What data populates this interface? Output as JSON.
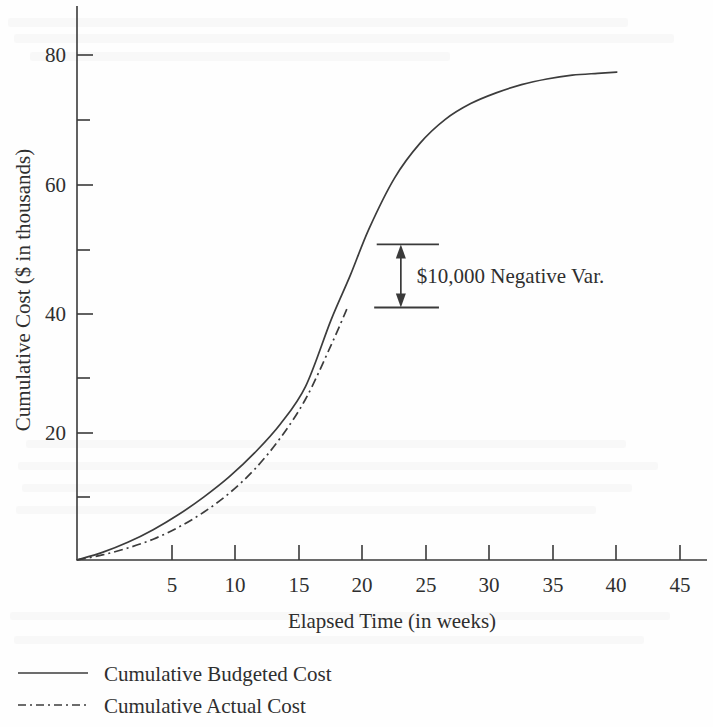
{
  "chart_data": {
    "type": "line",
    "title": "",
    "xlabel": "Elapsed Time (in weeks)",
    "ylabel": "Cumulative Cost ($ in thousands)",
    "xlim": [
      0,
      47
    ],
    "ylim": [
      0,
      88
    ],
    "grid": false,
    "legend_position": "below-left",
    "x_ticks": [
      5,
      10,
      15,
      20,
      25,
      30,
      35,
      40,
      45
    ],
    "x_tick_labels": [
      "5",
      "10",
      "15",
      "20",
      "25",
      "30",
      "35",
      "40",
      "45"
    ],
    "y_ticks": [
      10,
      20,
      30,
      40,
      50,
      60,
      70,
      80
    ],
    "y_tick_labels": [
      "",
      "20",
      "",
      "40",
      "",
      "60",
      "",
      "80"
    ],
    "y_labeled_ticks": [
      20,
      40,
      60,
      80
    ],
    "series": [
      {
        "name": "Cumulative Budgeted Cost",
        "style": "solid",
        "x": [
          0,
          2,
          4,
          6,
          8,
          10,
          12,
          14,
          16,
          18,
          20,
          21.5,
          23,
          25,
          27,
          29,
          31,
          33,
          35,
          37,
          39,
          41,
          42.5
        ],
        "values": [
          0,
          1.2,
          2.8,
          4.8,
          7.2,
          10.0,
          13.2,
          17.0,
          21.5,
          27.5,
          38.0,
          45.0,
          52.5,
          60.5,
          66.0,
          69.8,
          72.3,
          74.0,
          75.3,
          76.2,
          76.8,
          77.1,
          77.3
        ]
      },
      {
        "name": "Cumulative Actual Cost",
        "style": "dash-dot",
        "x": [
          0,
          2,
          4,
          6,
          8,
          10,
          12,
          14,
          16,
          18,
          20,
          21.3
        ],
        "values": [
          0,
          0.8,
          1.9,
          3.3,
          5.2,
          7.6,
          10.6,
          14.4,
          19.3,
          25.5,
          34.0,
          40.0
        ]
      }
    ],
    "annotations": [
      {
        "text": "$10,000 Negative Var.",
        "type": "variance-bracket",
        "upper_value": 50,
        "lower_value": 40,
        "x_start": 23.8,
        "x_end": 28.5,
        "arrow_x": 25.5
      }
    ]
  },
  "legend": {
    "items": [
      {
        "label": "Cumulative Budgeted Cost",
        "style": "solid"
      },
      {
        "label": "Cumulative Actual Cost",
        "style": "dash-dot"
      }
    ]
  },
  "axes": {
    "x_title": "Elapsed Time (in weeks)",
    "y_title": "Cumulative Cost ($ in thousands)"
  }
}
